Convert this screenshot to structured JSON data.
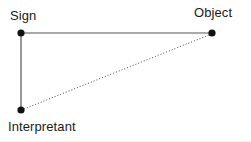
{
  "figure": {
    "background_color": "#ffffff",
    "width": 251,
    "height": 142
  },
  "nodes": [
    {
      "id": "sign",
      "label": "Sign",
      "x": 21,
      "y": 33,
      "radius": 3.6,
      "color": "#111111"
    },
    {
      "id": "object",
      "label": "Object",
      "x": 212,
      "y": 33,
      "radius": 3.6,
      "color": "#111111"
    },
    {
      "id": "interpretant",
      "label": "Interpretant",
      "x": 21,
      "y": 110,
      "radius": 3.6,
      "color": "#111111"
    }
  ],
  "edges": [
    {
      "id": "sign-object",
      "from": "sign",
      "to": "object",
      "style": "solid",
      "color": "#55555a",
      "width": 1.2
    },
    {
      "id": "sign-interpretant",
      "from": "sign",
      "to": "interpretant",
      "style": "solid",
      "color": "#55555a",
      "width": 1.2
    },
    {
      "id": "interpretant-object",
      "from": "interpretant",
      "to": "object",
      "style": "dotted",
      "color": "#4a4a50",
      "width": 1,
      "dash": "1 2"
    }
  ],
  "edge_geometry": {
    "sign_object": {
      "x1": 21,
      "y1": 33,
      "x2": 212,
      "y2": 33
    },
    "sign_interpretant": {
      "x1": 21,
      "y1": 33,
      "x2": 21,
      "y2": 110
    },
    "interpretant_object": {
      "x1": 24,
      "y1": 109,
      "x2": 209,
      "y2": 35
    }
  },
  "colors": {
    "node_fill": "#111111",
    "solid_line": "#55555a",
    "dotted_line": "#4a4a50",
    "text": "#1b1b1b",
    "background": "#ffffff",
    "scan_edge": "#f2f2f2"
  }
}
